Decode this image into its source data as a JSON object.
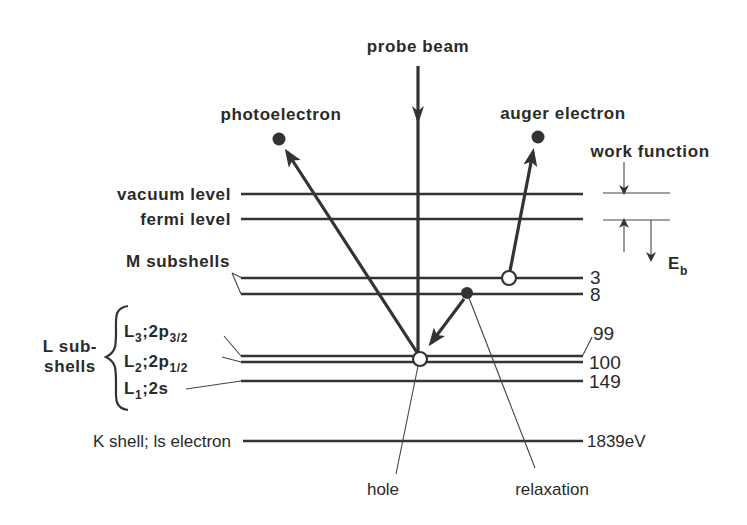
{
  "diagram": {
    "title": "probe beam",
    "particles": {
      "photoelectron": "photoelectron",
      "auger": "auger electron"
    },
    "levels": {
      "vacuum": "vacuum level",
      "fermi": "fermi level",
      "m_subshells": "M subshells",
      "l_group_line1": "L sub-",
      "l_group_line2": "shells",
      "l3_main": "L",
      "l3_sub": "3",
      "l3_orbital": ";2p",
      "l3_orbital_sub": "3/2",
      "l2_main": "L",
      "l2_sub": "2",
      "l2_orbital": ";2p",
      "l2_orbital_sub": "1/2",
      "l1_main": "L",
      "l1_sub": "1",
      "l1_orbital": ";2s",
      "k_shell": "K shell; ls electron"
    },
    "energies": {
      "m3": "3",
      "m8": "8",
      "l3": "99",
      "l2": "100",
      "l1": "149",
      "k": "1839eV"
    },
    "work_function": "work function",
    "binding_energy_main": "E",
    "binding_energy_sub": "b",
    "annotations": {
      "hole": "hole",
      "relaxation": "relaxation"
    },
    "colors": {
      "ink": "#2a2a2a",
      "background": "#ffffff"
    }
  }
}
